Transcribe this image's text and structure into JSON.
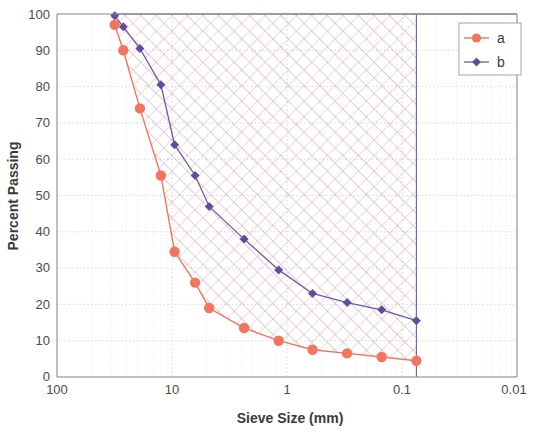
{
  "chart_data": {
    "type": "line",
    "title": "",
    "xlabel": "Sieve Size (mm)",
    "ylabel": "Percent Passing",
    "x_scale": "log",
    "x_reversed": true,
    "xlim": [
      100,
      0.01
    ],
    "ylim": [
      0,
      100
    ],
    "x_ticks": [
      "100",
      "10",
      "1",
      "0.1",
      "0.01"
    ],
    "x_tick_values": [
      100,
      10,
      1,
      0.1,
      0.01
    ],
    "y_ticks": [
      "0",
      "10",
      "20",
      "30",
      "40",
      "50",
      "60",
      "70",
      "80",
      "90",
      "100"
    ],
    "y_tick_values": [
      0,
      10,
      20,
      30,
      40,
      50,
      60,
      70,
      80,
      90,
      100
    ],
    "grid": true,
    "minor_grid": true,
    "legend_position": "top-right",
    "series": [
      {
        "name": "a",
        "color": "#F4755F",
        "marker": "circle",
        "x": [
          31.5,
          26.5,
          19.0,
          12.5,
          9.5,
          6.3,
          4.75,
          2.36,
          1.18,
          0.6,
          0.3,
          0.15,
          0.075
        ],
        "values": [
          97,
          90,
          74,
          55.5,
          34.5,
          26,
          19,
          13.5,
          10,
          7.5,
          6.5,
          5.5,
          4.5
        ]
      },
      {
        "name": "b",
        "color": "#6B5BA8",
        "marker": "diamond",
        "x": [
          31.5,
          26.5,
          19.0,
          12.5,
          9.5,
          6.3,
          4.75,
          2.36,
          1.18,
          0.6,
          0.3,
          0.15,
          0.075
        ],
        "values": [
          99.5,
          96.5,
          90.5,
          80.5,
          64,
          55.5,
          47,
          38,
          29.5,
          23,
          20.5,
          18.5,
          15.5
        ]
      }
    ],
    "fill_band": {
      "between": [
        "a",
        "b"
      ],
      "hatch": "crosshatch",
      "upper_bound_y": 100,
      "right_bound_x": 0.075
    },
    "colors": {
      "series_a": "#F4755F",
      "series_b": "#6B5BA8",
      "axis": "#7a7a7a",
      "grid": "#d8d8e0",
      "text": "#3a3a3a",
      "background": "#ffffff"
    }
  },
  "legend": {
    "entries": [
      {
        "label": "a"
      },
      {
        "label": "b"
      }
    ]
  },
  "axes": {
    "x_title": "Sieve Size (mm)",
    "y_title": "Percent Passing"
  }
}
